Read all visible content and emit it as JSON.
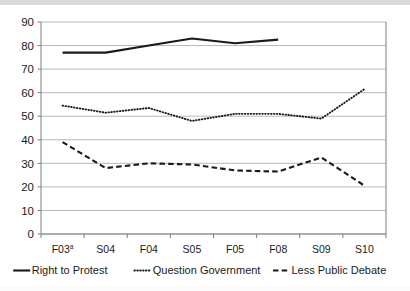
{
  "chart_data": {
    "type": "line",
    "title": "",
    "subtitle": "",
    "xlabel": "",
    "ylabel": "",
    "categories": [
      "F03ª",
      "S04",
      "F04",
      "S05",
      "F05",
      "F08",
      "S09",
      "S10"
    ],
    "ylim": [
      0,
      90
    ],
    "ytick_step": 10,
    "yticks": [
      0,
      10,
      20,
      30,
      40,
      50,
      60,
      70,
      80,
      90
    ],
    "ytick_labels": [
      "0",
      "10",
      "20",
      "30",
      "40",
      "50",
      "60",
      "70",
      "80",
      "90"
    ],
    "grid": "horizontal",
    "legend_position": "bottom",
    "series": [
      {
        "name": "Right to Protest",
        "style": "solid",
        "color": "#1a1a1a",
        "values": [
          77,
          77,
          80,
          83,
          81,
          82.5,
          null,
          null
        ]
      },
      {
        "name": "Question Government",
        "style": "dotted",
        "color": "#1a1a1a",
        "values": [
          54.5,
          51.5,
          53.5,
          48,
          51,
          51,
          49,
          61.5
        ]
      },
      {
        "name": "Less Public Debate",
        "style": "dashed",
        "color": "#1a1a1a",
        "values": [
          39,
          28,
          30,
          29.5,
          27,
          26.5,
          32.5,
          20.5
        ]
      }
    ]
  },
  "axis": {
    "y_labels": [
      "90",
      "80",
      "70",
      "60",
      "50",
      "40",
      "30",
      "20",
      "10",
      "0"
    ],
    "x_labels": [
      "F03",
      "S04",
      "F04",
      "S05",
      "F05",
      "F08",
      "S09",
      "S10"
    ],
    "x_first_superscript": "a"
  },
  "legend": {
    "items": [
      {
        "label": "Right to Protest",
        "style": "solid"
      },
      {
        "label": "Question Government",
        "style": "dotted"
      },
      {
        "label": "Less Public Debate",
        "style": "dashed"
      }
    ]
  }
}
